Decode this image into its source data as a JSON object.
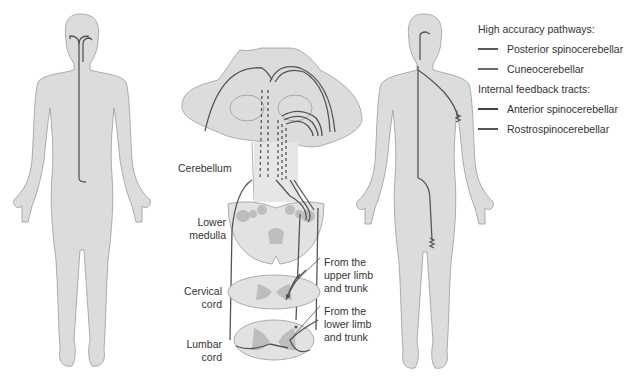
{
  "labels": {
    "cerebellum": "Cerebellum",
    "lower_medulla_1": "Lower",
    "lower_medulla_2": "medulla",
    "cervical_1": "Cervical",
    "cervical_2": "cord",
    "lumbar_1": "Lumbar",
    "lumbar_2": "cord",
    "upper_1": "From the",
    "upper_2": "upper limb",
    "upper_3": "and trunk",
    "lower_1": "From the",
    "lower_2": "lower limb",
    "lower_3": "and trunk"
  },
  "legend": {
    "group1": "High accuracy pathways:",
    "group1_items": [
      {
        "label": "Posterior spinocerebellar",
        "color": "#5a5a5a"
      },
      {
        "label": "Cuneocerebellar",
        "color": "#6a6a6a"
      }
    ],
    "group2": "Internal feedback tracts:",
    "group2_items": [
      {
        "label": "Anterior spinocerebellar",
        "color": "#444444"
      },
      {
        "label": "Rostrospinocerebellar",
        "color": "#555555"
      }
    ]
  },
  "colors": {
    "body": "#dcdcdc",
    "outline": "#9a9a9a",
    "tract": "#555555",
    "grey_matter": "#bdbdbd"
  }
}
